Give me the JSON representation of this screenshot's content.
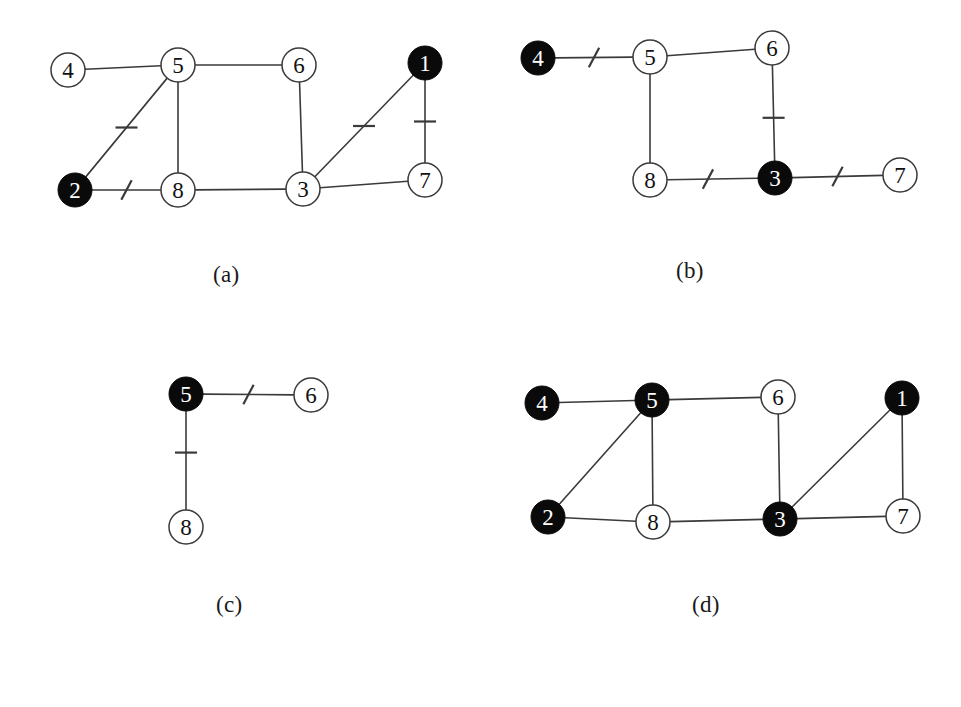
{
  "figure": {
    "background": "#ffffff",
    "stroke_color": "#3a3a3a",
    "node_fill_white": "#ffffff",
    "node_fill_black": "#0a0a0a",
    "label_color_dark": "#111111",
    "label_color_light": "#ffffff",
    "node_radius": 17
  },
  "captions": {
    "a": "(a)",
    "b": "(b)",
    "c": "(c)",
    "d": "(d)"
  },
  "panels": [
    {
      "id": "a",
      "caption": "(a)",
      "nodes": [
        {
          "id": "4",
          "label": "4",
          "x": 68,
          "y": 70,
          "filled": false
        },
        {
          "id": "5",
          "label": "5",
          "x": 178,
          "y": 65,
          "filled": false
        },
        {
          "id": "6",
          "label": "6",
          "x": 299,
          "y": 65,
          "filled": false
        },
        {
          "id": "1",
          "label": "1",
          "x": 425,
          "y": 63,
          "filled": true
        },
        {
          "id": "2",
          "label": "2",
          "x": 75,
          "y": 190,
          "filled": true
        },
        {
          "id": "8",
          "label": "8",
          "x": 178,
          "y": 190,
          "filled": false
        },
        {
          "id": "3",
          "label": "3",
          "x": 303,
          "y": 189,
          "filled": false
        },
        {
          "id": "7",
          "label": "7",
          "x": 425,
          "y": 180,
          "filled": false
        }
      ],
      "edges": [
        {
          "from": "4",
          "to": "5",
          "tick": false
        },
        {
          "from": "5",
          "to": "6",
          "tick": false
        },
        {
          "from": "5",
          "to": "2",
          "tick": true,
          "tick_pos": 0.5
        },
        {
          "from": "5",
          "to": "8",
          "tick": false
        },
        {
          "from": "6",
          "to": "3",
          "tick": false
        },
        {
          "from": "2",
          "to": "8",
          "tick": true,
          "tick_pos": 0.5
        },
        {
          "from": "8",
          "to": "3",
          "tick": false
        },
        {
          "from": "3",
          "to": "7",
          "tick": false
        },
        {
          "from": "3",
          "to": "1",
          "tick": true,
          "tick_pos": 0.5
        },
        {
          "from": "1",
          "to": "7",
          "tick": true,
          "tick_pos": 0.5
        }
      ]
    },
    {
      "id": "b",
      "caption": "(b)",
      "nodes": [
        {
          "id": "4",
          "label": "4",
          "x": 538,
          "y": 58,
          "filled": true
        },
        {
          "id": "5",
          "label": "5",
          "x": 650,
          "y": 57,
          "filled": false
        },
        {
          "id": "6",
          "label": "6",
          "x": 772,
          "y": 48,
          "filled": false
        },
        {
          "id": "8",
          "label": "8",
          "x": 650,
          "y": 180,
          "filled": false
        },
        {
          "id": "3",
          "label": "3",
          "x": 775,
          "y": 178,
          "filled": true
        },
        {
          "id": "7",
          "label": "7",
          "x": 900,
          "y": 175,
          "filled": false
        }
      ],
      "edges": [
        {
          "from": "4",
          "to": "5",
          "tick": true,
          "tick_pos": 0.5
        },
        {
          "from": "5",
          "to": "6",
          "tick": false
        },
        {
          "from": "5",
          "to": "8",
          "tick": false
        },
        {
          "from": "6",
          "to": "3",
          "tick": true,
          "tick_pos": 0.55
        },
        {
          "from": "8",
          "to": "3",
          "tick": true,
          "tick_pos": 0.45
        },
        {
          "from": "3",
          "to": "7",
          "tick": true,
          "tick_pos": 0.5
        }
      ]
    },
    {
      "id": "c",
      "caption": "(c)",
      "nodes": [
        {
          "id": "5",
          "label": "5",
          "x": 186,
          "y": 394,
          "filled": true
        },
        {
          "id": "6",
          "label": "6",
          "x": 311,
          "y": 395,
          "filled": false
        },
        {
          "id": "8",
          "label": "8",
          "x": 186,
          "y": 527,
          "filled": false
        }
      ],
      "edges": [
        {
          "from": "5",
          "to": "6",
          "tick": true,
          "tick_pos": 0.5
        },
        {
          "from": "5",
          "to": "8",
          "tick": true,
          "tick_pos": 0.42
        }
      ]
    },
    {
      "id": "d",
      "caption": "(d)",
      "nodes": [
        {
          "id": "4",
          "label": "4",
          "x": 542,
          "y": 403,
          "filled": true
        },
        {
          "id": "5",
          "label": "5",
          "x": 652,
          "y": 400,
          "filled": true
        },
        {
          "id": "6",
          "label": "6",
          "x": 778,
          "y": 397,
          "filled": false
        },
        {
          "id": "1",
          "label": "1",
          "x": 902,
          "y": 398,
          "filled": true
        },
        {
          "id": "2",
          "label": "2",
          "x": 548,
          "y": 517,
          "filled": true
        },
        {
          "id": "8",
          "label": "8",
          "x": 653,
          "y": 522,
          "filled": false
        },
        {
          "id": "3",
          "label": "3",
          "x": 780,
          "y": 519,
          "filled": true
        },
        {
          "id": "7",
          "label": "7",
          "x": 903,
          "y": 516,
          "filled": false
        }
      ],
      "edges": [
        {
          "from": "4",
          "to": "5",
          "tick": false
        },
        {
          "from": "5",
          "to": "6",
          "tick": false
        },
        {
          "from": "5",
          "to": "2",
          "tick": false
        },
        {
          "from": "5",
          "to": "8",
          "tick": false
        },
        {
          "from": "6",
          "to": "3",
          "tick": false
        },
        {
          "from": "2",
          "to": "8",
          "tick": false
        },
        {
          "from": "8",
          "to": "3",
          "tick": false
        },
        {
          "from": "3",
          "to": "7",
          "tick": false
        },
        {
          "from": "3",
          "to": "1",
          "tick": false
        },
        {
          "from": "1",
          "to": "7",
          "tick": false
        }
      ]
    }
  ]
}
